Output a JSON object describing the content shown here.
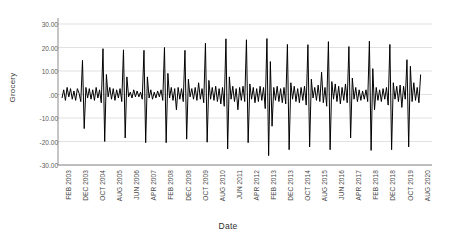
{
  "chart_data": {
    "type": "line",
    "title": "",
    "xlabel": "Date",
    "ylabel": "Grocery",
    "ylim": [
      -30,
      30
    ],
    "ytick_labels": [
      "30.00",
      "20.00",
      "10.00",
      ".00",
      "-10.00",
      "-20.00",
      "-30.00"
    ],
    "ytick_values": [
      30,
      20,
      10,
      0,
      -10,
      -20,
      -30
    ],
    "grid": "horizontal",
    "legend": "none",
    "line_color": "#000000",
    "background_color": "#FFFFFF",
    "gridline_color": "#D9D9D9",
    "axis_color": "#808080",
    "x_start": "FEB 2003",
    "x_end": "AUG 2020",
    "x_tick_step_months": 10,
    "xtick_labels": [
      "FEB 2003",
      "DEC 2003",
      "OCT 2004",
      "AUG 2005",
      "JUN 2006",
      "APR 2007",
      "FEB 2008",
      "DEC 2008",
      "OCT 2009",
      "AUG 2010",
      "JUN 2011",
      "APR 2012",
      "FEB 2013",
      "DEC 2013",
      "OCT 2014",
      "AUG 2015",
      "JUN 2016",
      "APR 2017",
      "FEB 2018",
      "DEC 2018",
      "OCT 2019",
      "AUG 2020"
    ],
    "series": [
      {
        "name": "Grocery",
        "values": [
          -1.5,
          2.0,
          -2.5,
          3.0,
          -1.0,
          2.5,
          -2.0,
          1.5,
          -2.5,
          2.5,
          0.5,
          -3.0,
          14.5,
          -14.5,
          3.0,
          -1.5,
          2.5,
          -2.0,
          2.0,
          -2.5,
          3.0,
          -1.5,
          2.0,
          -3.5,
          19.5,
          -20.0,
          8.5,
          -1.0,
          3.0,
          -2.0,
          2.5,
          -2.5,
          2.0,
          -1.5,
          2.5,
          -3.0,
          19.0,
          -18.5,
          7.5,
          -1.0,
          1.0,
          -1.5,
          2.0,
          -1.0,
          1.5,
          -1.0,
          1.0,
          -2.0,
          18.8,
          -20.5,
          7.5,
          -1.5,
          2.0,
          -2.0,
          1.0,
          -1.5,
          1.5,
          -1.0,
          2.0,
          -2.5,
          20.0,
          -20.5,
          9.0,
          -1.5,
          3.0,
          -2.5,
          2.5,
          -6.5,
          3.0,
          -2.0,
          2.5,
          -3.0,
          18.8,
          -19.0,
          6.5,
          -1.0,
          2.5,
          -2.0,
          3.0,
          -2.5,
          5.0,
          -2.0,
          2.5,
          -3.5,
          21.8,
          -20.3,
          6.0,
          -2.0,
          3.0,
          -2.5,
          3.5,
          -3.0,
          2.5,
          -4.0,
          3.0,
          -5.0,
          23.7,
          -23.2,
          7.5,
          -2.0,
          3.5,
          -3.0,
          2.5,
          -6.5,
          3.0,
          -2.5,
          3.5,
          -3.0,
          23.3,
          -20.5,
          4.5,
          -2.0,
          3.0,
          -3.5,
          2.5,
          -3.0,
          3.5,
          -2.5,
          3.0,
          -6.0,
          23.8,
          -26.0,
          14.0,
          -13.5,
          3.0,
          -2.5,
          3.5,
          -3.0,
          2.5,
          -3.5,
          3.0,
          -4.0,
          21.3,
          -23.5,
          5.0,
          -2.0,
          3.5,
          -3.0,
          2.5,
          -3.5,
          3.0,
          -2.5,
          3.5,
          -4.5,
          21.2,
          -22.3,
          6.5,
          -1.5,
          3.0,
          -2.5,
          4.0,
          -3.0,
          9.5,
          -3.5,
          3.0,
          -5.0,
          22.5,
          -23.5,
          5.5,
          -2.0,
          4.5,
          -3.0,
          3.5,
          -4.0,
          3.0,
          -2.5,
          4.5,
          -3.5,
          20.4,
          -18.5,
          7.0,
          -2.0,
          3.0,
          -3.0,
          2.0,
          -2.5,
          1.5,
          -2.0,
          2.0,
          -3.0,
          22.7,
          -23.8,
          11.0,
          -6.5,
          3.0,
          -2.5,
          2.0,
          -3.0,
          2.5,
          -2.0,
          3.0,
          -4.5,
          21.3,
          -23.5,
          5.0,
          -2.0,
          3.5,
          -3.0,
          4.0,
          -5.5,
          3.5,
          -2.0,
          14.8,
          -22.3,
          12.0,
          -3.0,
          5.0,
          -2.5,
          3.0,
          -3.5,
          8.5
        ]
      }
    ]
  },
  "axis": {
    "y_title": "Grocery",
    "x_title": "Date"
  }
}
